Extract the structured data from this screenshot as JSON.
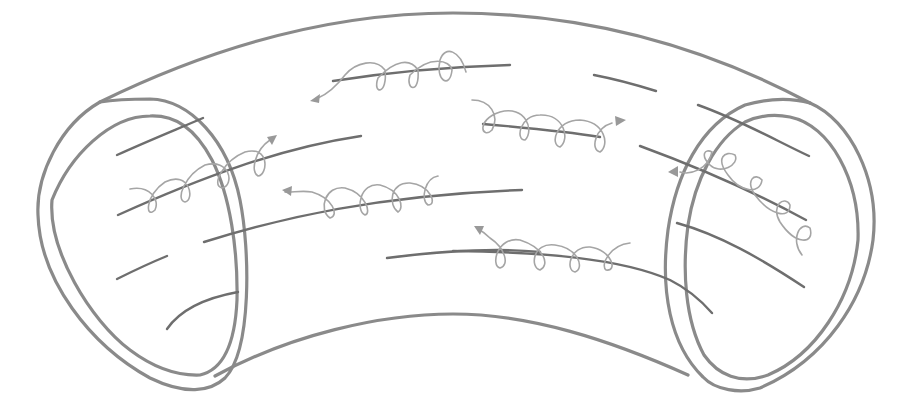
{
  "diagram": {
    "title": "",
    "colors": {
      "background": "#ffffff",
      "tube_outline": "#8a8a8a",
      "field_line": "#6e6e6e",
      "helix_path": "#a5a5a5",
      "arrow": "#999999"
    },
    "elements": {
      "tube_body": "curved-tube",
      "left_opening": "ellipse-double-ring",
      "right_opening": "ellipse-double-ring",
      "field_lines_count": 13,
      "helical_trajectories_count": 6,
      "helix_directions": [
        "left",
        "right",
        "right",
        "left",
        "left",
        "left"
      ]
    },
    "labels": []
  }
}
